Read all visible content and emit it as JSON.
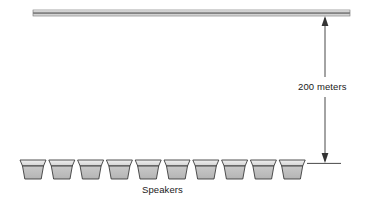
{
  "diagram": {
    "background_color": "#ffffff",
    "stroke_color": "#333333",
    "beam": {
      "name": "overhead-beam",
      "x": 33,
      "y": 10,
      "width": 317,
      "height": 6,
      "fill_top": "#f2f2f2",
      "fill_mid": "#8c8c8c",
      "fill_bottom": "#d9d9d9"
    },
    "dimension": {
      "label": "200 meters",
      "value": 200,
      "unit": "meters",
      "line_x": 325,
      "top_y": 16,
      "bottom_y": 163,
      "tick_x1": 307,
      "tick_x2": 341,
      "color": "#333333"
    },
    "speakers": {
      "label": "Speakers",
      "count": 10,
      "first_x": 20,
      "pitch": 28.8,
      "top_y": 160,
      "rim_height": 6,
      "body_height": 13,
      "rim_width": 26,
      "body_top_width": 24,
      "body_bottom_width": 17,
      "rim_fill": "#e6e6e6",
      "body_fill": "#bfbfbf",
      "outline": "#333333"
    }
  }
}
